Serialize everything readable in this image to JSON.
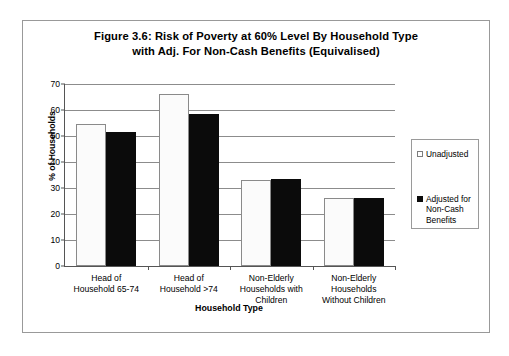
{
  "chart_data": {
    "type": "bar",
    "title": "Figure 3.6: Risk of Poverty at 60% Level By Household Type with Adj. For Non-Cash Benefits  (Equivalised)",
    "title_line1": "Figure 3.6: Risk of Poverty at 60% Level By Household Type",
    "title_line2": "with Adj. For Non-Cash Benefits  (Equivalised)",
    "xlabel": "Household Type",
    "ylabel": "% of Households",
    "ylim": [
      0,
      70
    ],
    "yticks": [
      0,
      10,
      20,
      30,
      40,
      50,
      60,
      70
    ],
    "ytick_labels": [
      "0",
      "10",
      "20",
      "30",
      "40",
      "50",
      "60",
      "70"
    ],
    "grid": true,
    "legend_position": "right",
    "categories": [
      "Head of Household 65-74",
      "Head of Household >74",
      "Non-Elderly Households with Children",
      "Non-Elderly Households Without Children"
    ],
    "category_lines": [
      [
        "Head of",
        "Household 65-74"
      ],
      [
        "Head of",
        "Household >74"
      ],
      [
        "Non-Elderly",
        "Households with",
        "Children"
      ],
      [
        "Non-Elderly",
        "Households",
        "Without Children"
      ]
    ],
    "series": [
      {
        "name": "Unadjusted",
        "color": "#FFFFFF",
        "values": [
          54.8,
          66.0,
          33.0,
          26.0
        ]
      },
      {
        "name": "Adjusted for Non-Cash Benefits",
        "legend_lines": "Adjusted for\nNon-Cash\nBenefits",
        "color": "#000000",
        "values": [
          51.6,
          58.5,
          33.6,
          26.2
        ]
      }
    ]
  },
  "figure": {
    "border_color": "#999999",
    "axis_color": "#555555",
    "grid_color": "#8C8C8C"
  }
}
